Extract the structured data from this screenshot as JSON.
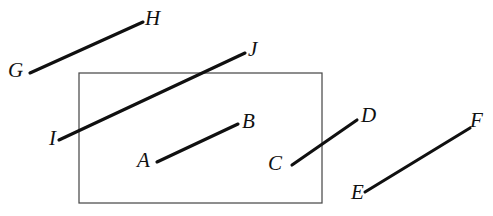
{
  "figure": {
    "background_color": "#ffffff",
    "segment_color": "#101010",
    "rectangle_color": "#4a4a4a",
    "label_color": "#111111",
    "width": 493,
    "height": 216
  },
  "rectangle": {
    "name": "rectangle",
    "x": 79,
    "y": 73,
    "width": 243,
    "height": 130
  },
  "segments": [
    {
      "id": "AB",
      "from": "A",
      "to": "B",
      "x1": 157,
      "y1": 162,
      "x2": 238,
      "y2": 124
    },
    {
      "id": "CD",
      "from": "C",
      "to": "D",
      "x1": 292,
      "y1": 165,
      "x2": 357,
      "y2": 120
    },
    {
      "id": "EF",
      "from": "E",
      "to": "F",
      "x1": 365,
      "y1": 192,
      "x2": 470,
      "y2": 128
    },
    {
      "id": "GH",
      "from": "G",
      "to": "H",
      "x1": 30,
      "y1": 73,
      "x2": 143,
      "y2": 22
    },
    {
      "id": "IJ",
      "from": "I",
      "to": "J",
      "x1": 59,
      "y1": 140,
      "x2": 245,
      "y2": 53
    }
  ],
  "labels": [
    {
      "id": "A",
      "text": "A",
      "x": 137,
      "y": 150
    },
    {
      "id": "B",
      "text": "B",
      "x": 242,
      "y": 111
    },
    {
      "id": "C",
      "text": "C",
      "x": 268,
      "y": 153
    },
    {
      "id": "D",
      "text": "D",
      "x": 361,
      "y": 105
    },
    {
      "id": "E",
      "text": "E",
      "x": 351,
      "y": 182
    },
    {
      "id": "F",
      "text": "F",
      "x": 470,
      "y": 110
    },
    {
      "id": "G",
      "text": "G",
      "x": 8,
      "y": 60
    },
    {
      "id": "H",
      "text": "H",
      "x": 145,
      "y": 8
    },
    {
      "id": "I",
      "text": "I",
      "x": 49,
      "y": 128
    },
    {
      "id": "J",
      "text": "J",
      "x": 248,
      "y": 39
    }
  ]
}
